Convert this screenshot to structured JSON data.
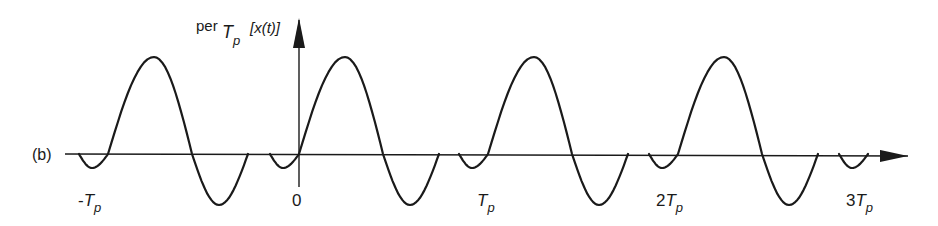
{
  "figure": {
    "panel_label": "(b)",
    "y_axis_label": {
      "prefix": "per",
      "sub_main": "T",
      "sub_index": "p",
      "argument": "[x(t)]"
    },
    "x_axis_ticks": [
      {
        "coef": "-",
        "main": "T",
        "index": "p",
        "x": 78
      },
      {
        "coef": "",
        "main": "0",
        "index": "",
        "x": 292
      },
      {
        "coef": "",
        "main": "T",
        "index": "p",
        "x": 477
      },
      {
        "coef": "2",
        "main": "T",
        "index": "p",
        "x": 656
      },
      {
        "coef": "3",
        "main": "T",
        "index": "p",
        "x": 846
      }
    ],
    "stroke_color": "#1a1a1a",
    "background": "#ffffff"
  },
  "chart_data": {
    "type": "line",
    "xlabel": "t",
    "ylabel": "per_Tp [x(t)]",
    "x_ticks": [
      "-Tp",
      "0",
      "Tp",
      "2Tp",
      "3Tp"
    ],
    "period_px": 190,
    "period_crossings_px": [
      108,
      299,
      488,
      678,
      868
    ],
    "axis_y_px": 154,
    "one_period_shape": {
      "relative_x_px": [
        -29,
        -16,
        0,
        46,
        84,
        111,
        140
      ],
      "y_px": [
        154,
        168,
        154,
        57,
        154,
        205,
        154
      ],
      "normalized_amplitude": [
        0,
        -0.14,
        0,
        1.0,
        0,
        -0.53,
        0
      ]
    },
    "grid": false,
    "legend": null
  }
}
